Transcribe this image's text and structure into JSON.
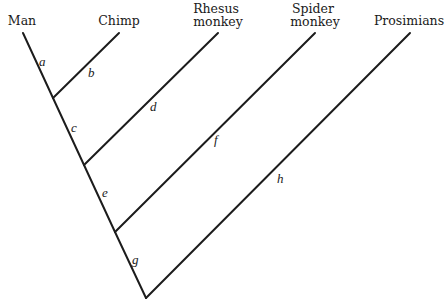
{
  "diagram": {
    "type": "phylogenetic-tree",
    "taxa": [
      {
        "id": "man",
        "lines": [
          "Man"
        ]
      },
      {
        "id": "chimp",
        "lines": [
          "Chimp"
        ]
      },
      {
        "id": "rhesus",
        "lines": [
          "Rhesus",
          "monkey"
        ]
      },
      {
        "id": "spider",
        "lines": [
          "Spider",
          "monkey"
        ]
      },
      {
        "id": "prosimians",
        "lines": [
          "Prosimians"
        ]
      }
    ],
    "branch_labels": {
      "a": "a",
      "b": "b",
      "c": "c",
      "d": "d",
      "e": "e",
      "f": "f",
      "g": "g",
      "h": "h"
    }
  }
}
